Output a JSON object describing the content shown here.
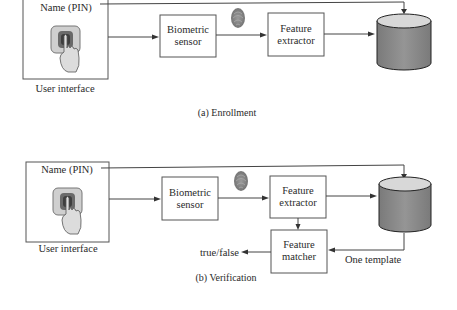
{
  "enrollment": {
    "caption": "(a) Enrollment",
    "user_interface": {
      "name_label": "Name (PIN)",
      "label": "User interface"
    },
    "biometric_sensor": {
      "line1": "Biometric",
      "line2": "sensor"
    },
    "feature_extractor": {
      "line1": "Feature",
      "line2": "extractor"
    },
    "database": {
      "icon": "database-cylinder-icon"
    }
  },
  "verification": {
    "caption": "(b) Verification",
    "user_interface": {
      "name_label": "Name (PIN)",
      "label": "User interface"
    },
    "biometric_sensor": {
      "line1": "Biometric",
      "line2": "sensor"
    },
    "feature_extractor": {
      "line1": "Feature",
      "line2": "extractor"
    },
    "feature_matcher": {
      "line1": "Feature",
      "line2": "matcher"
    },
    "output_label": "true/false",
    "template_label": "One template",
    "database": {
      "icon": "database-cylinder-icon"
    }
  },
  "colors": {
    "db_body": "#8a8a8a",
    "db_top": "#d8d8d8",
    "pad_outer": "#c8c8c8",
    "pad_inner": "#6a6a6a",
    "fingerprint": "#8c8c8c"
  }
}
